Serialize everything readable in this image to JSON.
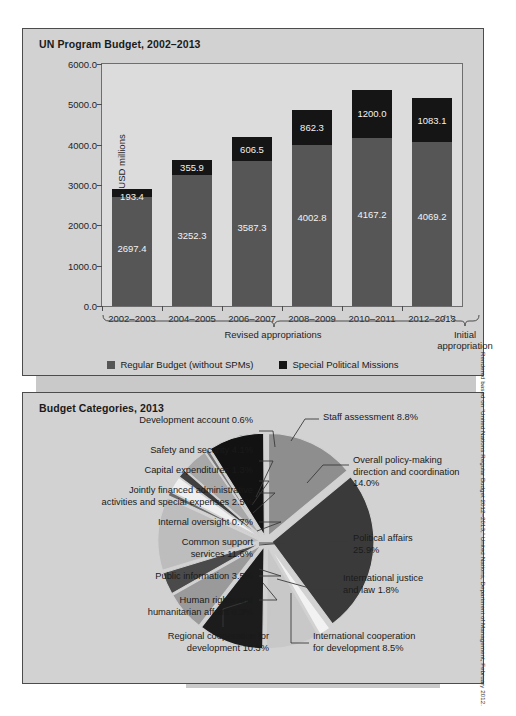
{
  "page": {
    "credit": "Rendered based on “United Nations Regular Budget 2012–2013,” United Nations, Department of Management, February 2012."
  },
  "bar_panel": {
    "title": "UN Program Budget, 2002–2013",
    "bracket_left_label": "Revised appropriations",
    "bracket_right_label_line1": "Initial",
    "bracket_right_label_line2": "appropriation",
    "legend": [
      {
        "label": "Regular Budget (without SPMs)",
        "color": "#565656",
        "icon": "square-swatch"
      },
      {
        "label": "Special Political Missions",
        "color": "#151515",
        "icon": "square-swatch"
      }
    ]
  },
  "pie_panel": {
    "title": "Budget Categories, 2013"
  },
  "chart_data": [
    {
      "type": "bar",
      "title": "UN Program Budget, 2002–2013",
      "xlabel": "",
      "ylabel": "USD millions",
      "ylim": [
        0,
        6000
      ],
      "yticks": [
        "0.0",
        "1000.0",
        "2000.0",
        "3000.0",
        "4000.0",
        "5000.0",
        "6000.0"
      ],
      "ytick_values": [
        0,
        1000,
        2000,
        3000,
        4000,
        5000,
        6000
      ],
      "grid": false,
      "stacked": true,
      "legend_position": "bottom",
      "categories": [
        "2002–2003",
        "2004–2005",
        "2006–2007",
        "2008–2009",
        "2010–2011",
        "2012–2013"
      ],
      "series": [
        {
          "name": "Regular Budget (without SPMs)",
          "color": "#565656",
          "values": [
            2697.4,
            3252.3,
            3587.3,
            4002.8,
            4167.2,
            4069.2
          ],
          "labels": [
            "2697.4",
            "3252.3",
            "3587.3",
            "4002.8",
            "4167.2",
            "4069.2"
          ]
        },
        {
          "name": "Special Political Missions",
          "color": "#151515",
          "values": [
            193.4,
            355.9,
            606.5,
            862.3,
            1200.0,
            1083.1
          ],
          "labels": [
            "193.4",
            "355.9",
            "606.5",
            "862.3",
            "1200.0",
            "1083.1"
          ]
        }
      ],
      "annotations": [
        {
          "text": "Revised appropriations",
          "covers": [
            "2002–2003",
            "2004–2005",
            "2006–2007",
            "2008–2009",
            "2010–2011"
          ]
        },
        {
          "text": "Initial appropriation",
          "covers": [
            "2012–2013"
          ]
        }
      ]
    },
    {
      "type": "pie",
      "title": "Budget Categories, 2013",
      "exploded": true,
      "unit": "percent",
      "slices": [
        {
          "label": "Overall policy-making direction and coordination",
          "value": 14.0,
          "text": "Overall policy-making direction and coordination 14.0%",
          "color": "#8e8e8e"
        },
        {
          "label": "Political affairs",
          "value": 25.9,
          "text": "Political affairs 25.9%",
          "color": "#3a3a3a"
        },
        {
          "label": "International justice and law",
          "value": 1.8,
          "text": "International justice and law 1.8%",
          "color": "#f2f2f2"
        },
        {
          "label": "International cooperation for development",
          "value": 8.5,
          "text": "International cooperation for development 8.5%",
          "color": "#c8c8c8"
        },
        {
          "label": "Regional cooperation for development",
          "value": 10.3,
          "text": "Regional cooperation for development 10.3%",
          "color": "#1c1c1c"
        },
        {
          "label": "Human rights and humanitarian affairs",
          "value": 6.3,
          "text": "Human rights and humanitarian affairs 6.3%",
          "color": "#9a9a9a"
        },
        {
          "label": "Public information",
          "value": 3.5,
          "text": "Public information 3.5%",
          "color": "#4a4a4a"
        },
        {
          "label": "Common support services",
          "value": 11.6,
          "text": "Common support services 11.6%",
          "color": "#bdbdbd"
        },
        {
          "label": "Internal oversight",
          "value": 0.7,
          "text": "Internal oversight 0.7%",
          "color": "#6a6a6a"
        },
        {
          "label": "Jointly financed administrative activities and special expenses",
          "value": 2.5,
          "text": "Jointly financed administrative activities and special expenses 2.5%",
          "color": "#efefef"
        },
        {
          "label": "Capital expenditures",
          "value": 1.3,
          "text": "Capital expenditures 1.3%",
          "color": "#3f3f3f"
        },
        {
          "label": "Safety and security",
          "value": 4.1,
          "text": "Safety and security 4.1%",
          "color": "#a8a8a8"
        },
        {
          "label": "Development account",
          "value": 0.6,
          "text": "Development account 0.6%",
          "color": "#747474"
        },
        {
          "label": "Staff assessment",
          "value": 8.8,
          "text": "Staff assessment 8.8%",
          "color": "#121212"
        }
      ]
    }
  ],
  "pie_labels": [
    {
      "id": "development-account",
      "text": "Development account 0.6%"
    },
    {
      "id": "staff-assessment",
      "text": "Staff assessment 8.8%"
    },
    {
      "id": "safety-and-security",
      "text": "Safety and security 4.1%"
    },
    {
      "id": "overall-policy-making",
      "text": "Overall policy-making\ndirection and coordination\n14.0%"
    },
    {
      "id": "capital-expenditures",
      "text": "Capital expenditures 1.3%"
    },
    {
      "id": "jointly-financed",
      "text": "Jointly financed administrative\nactivities and special expenses 2.5%"
    },
    {
      "id": "internal-oversight",
      "text": "Internal oversight 0.7%"
    },
    {
      "id": "common-support-services",
      "text": "Common support\nservices 11.6%"
    },
    {
      "id": "political-affairs",
      "text": "Political affairs\n25.9%"
    },
    {
      "id": "public-information",
      "text": "Public information 3.5%"
    },
    {
      "id": "international-justice",
      "text": "International justice\nand law 1.8%"
    },
    {
      "id": "human-rights",
      "text": "Human rights and\nhumanitarian affairs 6.3%"
    },
    {
      "id": "regional-cooperation",
      "text": "Regional cooperation for\ndevelopment 10.3%"
    },
    {
      "id": "international-cooperation",
      "text": "International cooperation\nfor development 8.5%"
    }
  ]
}
